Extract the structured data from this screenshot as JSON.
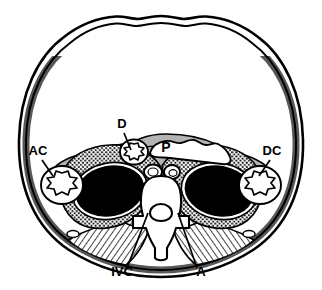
{
  "figure": {
    "view": "axial cross-section of the abdomen",
    "background_color": "#ffffff",
    "line_color": "#000000"
  },
  "palette": {
    "outline": "#000000",
    "body_wall_muscle": "#58585a",
    "pararenal_fat_gray": "#b3b3b3",
    "organ_black": "#000000",
    "organ_white": "#ffffff",
    "hatch_gray": "#8a8a8a",
    "stipple_gray": "#2b2b2b"
  },
  "labels": [
    {
      "id": "AC",
      "text": "AC",
      "name": "ascending-colon",
      "x": 38,
      "y": 155,
      "anchor": "middle"
    },
    {
      "id": "D",
      "text": "D",
      "name": "duodenum",
      "x": 122,
      "y": 128,
      "anchor": "middle"
    },
    {
      "id": "P",
      "text": "P",
      "name": "pancreas",
      "x": 166,
      "y": 152,
      "anchor": "middle"
    },
    {
      "id": "DC",
      "text": "DC",
      "name": "descending-colon",
      "x": 272,
      "y": 155,
      "anchor": "middle"
    },
    {
      "id": "RK",
      "text": "RK",
      "name": "right-kidney",
      "x": 110,
      "y": 196,
      "anchor": "middle"
    },
    {
      "id": "LK",
      "text": "LK",
      "name": "left-kidney",
      "x": 219,
      "y": 196,
      "anchor": "middle"
    },
    {
      "id": "IVC",
      "text": "IVC",
      "name": "inferior-vena-cava",
      "x": 122,
      "y": 276,
      "anchor": "middle"
    },
    {
      "id": "A",
      "text": "A",
      "name": "aorta",
      "x": 201,
      "y": 276,
      "anchor": "middle"
    }
  ],
  "leader_lines": [
    {
      "for": "AC",
      "x1": 42,
      "y1": 160,
      "x2": 53,
      "y2": 176
    },
    {
      "for": "D",
      "x1": 124,
      "y1": 133,
      "x2": 131,
      "y2": 150
    },
    {
      "for": "DC",
      "x1": 270,
      "y1": 160,
      "x2": 259,
      "y2": 176
    },
    {
      "for": "IVC",
      "x1": 127,
      "y1": 268,
      "x2": 148,
      "y2": 213
    },
    {
      "for": "A",
      "x1": 197,
      "y1": 268,
      "x2": 178,
      "y2": 213
    }
  ],
  "structures": [
    {
      "name": "skin-outline",
      "fill": "none",
      "note": "outer body contour"
    },
    {
      "name": "abdominal-wall-muscle",
      "fill": "#58585a",
      "note": "dark gray band, posterolateral"
    },
    {
      "name": "anterior-pararenal-fat",
      "fill": "#b3b3b3",
      "note": "mid gray wings containing colon, duodenum, pancreas"
    },
    {
      "name": "perirenal-fat",
      "fill": "stipple",
      "note": "dotted texture around kidneys"
    },
    {
      "name": "psoas-and-back-muscles",
      "fill": "hatch",
      "note": "diagonal hatch posteriorly"
    },
    {
      "name": "right-kidney-parenchyma",
      "fill": "#000000"
    },
    {
      "name": "left-kidney-parenchyma",
      "fill": "#000000"
    },
    {
      "name": "pancreas-body",
      "fill": "#ffffff"
    },
    {
      "name": "duodenum-lumen",
      "fill": "#ffffff"
    },
    {
      "name": "ascending-colon-lumen",
      "fill": "#ffffff"
    },
    {
      "name": "descending-colon-lumen",
      "fill": "#ffffff"
    },
    {
      "name": "vertebral-body",
      "fill": "#ffffff"
    },
    {
      "name": "spinal-canal",
      "fill": "#ffffff"
    },
    {
      "name": "inferior-vena-cava",
      "fill": "#ffffff"
    },
    {
      "name": "aorta",
      "fill": "#ffffff"
    }
  ]
}
